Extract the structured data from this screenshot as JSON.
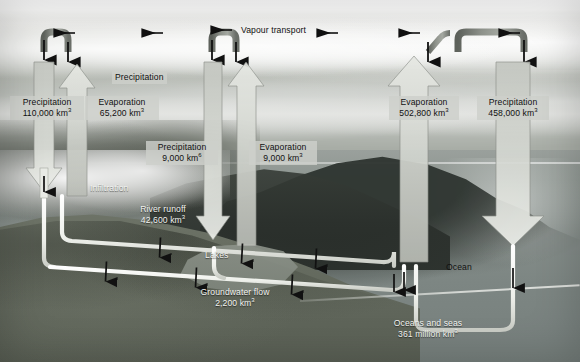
{
  "diagram": {
    "colors": {
      "pipe_dark": "#7f837d",
      "pipe_light": "#f2f2ee",
      "arrow_fill": "#c9ccc6",
      "arrow_stroke": "#6a6e68",
      "label_box": "#cdd0ca",
      "text_dark": "#111111",
      "text_light": "#f2f3f0"
    },
    "labels": {
      "vapour_transport": "Vapour transport",
      "precipitation_label": "Precipitation",
      "infiltration": "Infiltration",
      "lakes": "Lakes",
      "ocean": "Ocean"
    },
    "flows": [
      {
        "id": "land-precipitation",
        "name": "Precipitation",
        "value": "110,000",
        "unit": "km",
        "exponent": "3",
        "direction": "down",
        "region": "land-left"
      },
      {
        "id": "land-evaporation",
        "name": "Evaporation",
        "value": "65,200",
        "unit": "km",
        "exponent": "3",
        "direction": "up",
        "region": "land-left"
      },
      {
        "id": "inland-precipitation",
        "name": "Precipitation",
        "value": "9,000",
        "unit": "km",
        "exponent": "6",
        "direction": "down",
        "region": "land-centre"
      },
      {
        "id": "inland-evaporation",
        "name": "Evaporation",
        "value": "9,000",
        "unit": "km",
        "exponent": "3",
        "direction": "up",
        "region": "land-centre"
      },
      {
        "id": "ocean-evaporation",
        "name": "Evaporation",
        "value": "502,800",
        "unit": "km",
        "exponent": "3",
        "direction": "up",
        "region": "ocean"
      },
      {
        "id": "ocean-precipitation",
        "name": "Precipitation",
        "value": "458,000",
        "unit": "km",
        "exponent": "3",
        "direction": "down",
        "region": "ocean"
      },
      {
        "id": "river-runoff",
        "name": "River runoff",
        "value": "42,600",
        "unit": "km",
        "exponent": "3",
        "direction": "to-ocean",
        "region": "land-surface"
      },
      {
        "id": "groundwater-flow",
        "name": "Groundwater flow",
        "value": "2,200",
        "unit": "km",
        "exponent": "3",
        "direction": "to-ocean",
        "region": "subsurface"
      }
    ],
    "reservoir": {
      "name": "Oceans and seas",
      "value": "361 million",
      "unit": "km",
      "exponent": "3"
    }
  }
}
